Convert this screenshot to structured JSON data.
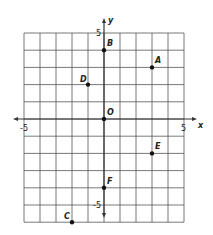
{
  "diagram": {
    "type": "coordinate-plane",
    "axes": {
      "x_label": "x",
      "y_label": "y"
    },
    "x_range": [
      -5,
      5
    ],
    "y_range": [
      -6,
      5
    ],
    "tick_labels": {
      "x_neg": "-5",
      "x_pos": "5",
      "y_pos": "5",
      "y_neg": "-5"
    },
    "points": [
      {
        "name": "A",
        "x": 3,
        "y": 3
      },
      {
        "name": "B",
        "x": 0,
        "y": 4
      },
      {
        "name": "C",
        "x": -2,
        "y": -6
      },
      {
        "name": "D",
        "x": -1,
        "y": 2
      },
      {
        "name": "E",
        "x": 3,
        "y": -2
      },
      {
        "name": "F",
        "x": 0,
        "y": -4
      },
      {
        "name": "O",
        "x": 0,
        "y": 0
      }
    ],
    "colors": {
      "grid": "#555555",
      "axis": "#333333",
      "point": "#111111",
      "background": "#ffffff"
    }
  }
}
